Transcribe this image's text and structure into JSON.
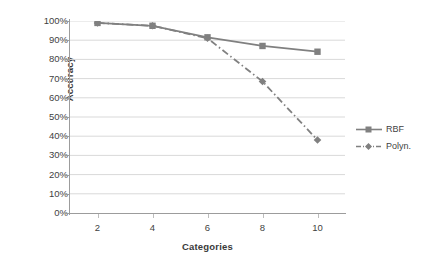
{
  "chart_data": {
    "type": "line",
    "title": "",
    "xlabel": "Categories",
    "ylabel": "Accuracy",
    "x": [
      2,
      4,
      6,
      8,
      10
    ],
    "categories": [
      "2",
      "4",
      "6",
      "8",
      "10"
    ],
    "xlim": [
      1,
      11
    ],
    "ylim": [
      0,
      100
    ],
    "y_tick_labels": [
      "0%",
      "10%",
      "20%",
      "30%",
      "40%",
      "50%",
      "60%",
      "70%",
      "80%",
      "90%",
      "100%"
    ],
    "y_tick_values": [
      0,
      10,
      20,
      30,
      40,
      50,
      60,
      70,
      80,
      90,
      100
    ],
    "grid": "horizontal",
    "legend_position": "right",
    "series": [
      {
        "name": "RBF",
        "values": [
          99,
          97.5,
          91.5,
          87,
          84
        ],
        "line_style": "solid",
        "marker": "square",
        "color": "#808080"
      },
      {
        "name": "Polyn.",
        "values": [
          99,
          97.5,
          91,
          68.5,
          38
        ],
        "line_style": "dash-dot",
        "marker": "diamond",
        "color": "#808080"
      }
    ]
  },
  "legend": {
    "items": [
      {
        "label": "RBF",
        "swatch": "solid-line-square-marker"
      },
      {
        "label": "Polyn.",
        "swatch": "dashed-line-diamond-marker"
      }
    ]
  },
  "colors": {
    "series_gray": "#808080",
    "gridline": "#d9d9d9",
    "axis": "#9c9c9c",
    "text": "#3f3f3f",
    "background": "#ffffff"
  }
}
